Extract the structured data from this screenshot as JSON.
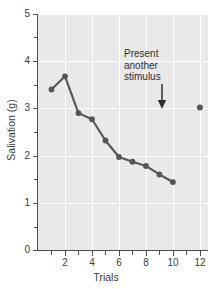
{
  "chart_data": {
    "type": "line",
    "title": "",
    "xlabel": "Trials",
    "ylabel": "Salivation (g)",
    "xlim": [
      0,
      12.6
    ],
    "ylim": [
      0,
      5
    ],
    "grid": true,
    "legend": "none",
    "x": [
      1,
      2,
      3,
      4,
      5,
      6,
      7,
      8,
      9,
      10
    ],
    "values": [
      3.4,
      3.68,
      2.9,
      2.77,
      2.32,
      1.97,
      1.87,
      1.78,
      1.6,
      1.44
    ],
    "series": [
      {
        "name": "Salivation across extinction trials",
        "x": [
          1,
          2,
          3,
          4,
          5,
          6,
          7,
          8,
          9,
          10
        ],
        "values": [
          3.4,
          3.68,
          2.9,
          2.77,
          2.32,
          1.97,
          1.87,
          1.78,
          1.6,
          1.44
        ],
        "connected": true
      },
      {
        "name": "Spontaneous recovery point",
        "x": [
          12
        ],
        "values": [
          3.02
        ],
        "connected": false
      }
    ],
    "x_ticks_major": [
      2,
      4,
      6,
      8,
      10,
      12
    ],
    "x_ticks_minor": [
      1,
      3,
      5,
      7,
      9,
      11
    ],
    "x_ticklabels": [
      "2",
      "4",
      "6",
      "8",
      "10",
      "12"
    ],
    "y_ticks_major": [
      0,
      1,
      2,
      3,
      4,
      5
    ],
    "y_ticks_minor": [
      0.5,
      1.5,
      2.5,
      3.5,
      4.5
    ],
    "y_ticklabels": [
      "0",
      "1",
      "2",
      "3",
      "4",
      "5"
    ],
    "annotations": [
      {
        "name": "present-another-stimulus",
        "lines": [
          "Present",
          "another",
          "stimulus"
        ],
        "line1": "Present",
        "line2": "another",
        "line3": "stimulus",
        "arrow": "down-arrow",
        "points_to_x": 11,
        "points_to_y": 3.05
      }
    ],
    "colors": {
      "plot_background": "#e9e9e9",
      "figure_background": "#ffffff",
      "gridline": "#ffffff",
      "axis": "#4d4d4d",
      "line": "#555555",
      "marker": "#555555",
      "text": "#3b3b3b"
    }
  }
}
